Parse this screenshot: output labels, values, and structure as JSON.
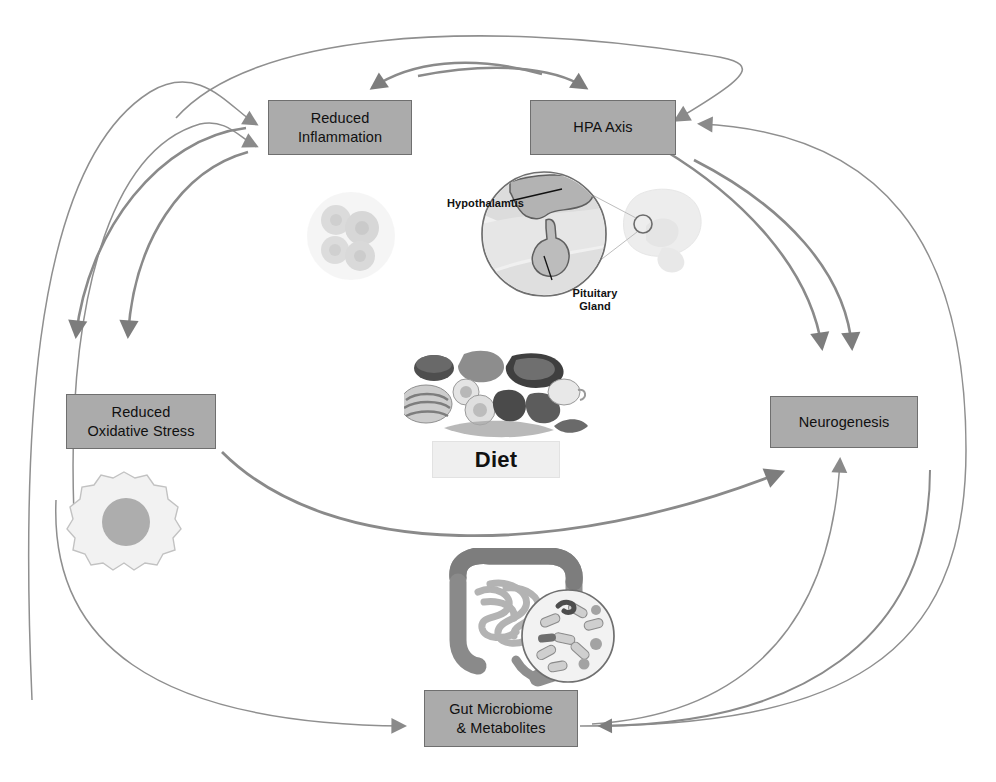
{
  "figure": {
    "type": "cyclical pathway diagram",
    "background_color": "#ffffff",
    "node_fill": "#ababab",
    "node_border": "#6f6f6f",
    "arrow_color_thick": "#808080",
    "arrow_color_thin": "#8f8f8f"
  },
  "nodes": [
    {
      "id": "reduced-inflammation",
      "line1": "Reduced",
      "line2": "Inflammation"
    },
    {
      "id": "hpa-axis",
      "line1": "HPA Axis",
      "line2": ""
    },
    {
      "id": "reduced-oxidative",
      "line1": "Reduced",
      "line2": "Oxidative Stress"
    },
    {
      "id": "neurogenesis",
      "line1": "Neurogenesis",
      "line2": ""
    },
    {
      "id": "gut-microbiome",
      "line1": "Gut Microbiome",
      "line2": "& Metabolites"
    }
  ],
  "center": {
    "diet_label": "Diet"
  },
  "illustration_labels": {
    "hypothalamus": "Hypothalamus",
    "pituitary_line1": "Pituitary",
    "pituitary_line2": "Gland"
  },
  "illustrations": [
    {
      "id": "immune-cells",
      "name": "immune-cell-cluster-illustration"
    },
    {
      "id": "hpa",
      "name": "brain-hypothalamus-pituitary-magnifier-illustration"
    },
    {
      "id": "food",
      "name": "assorted-foods-illustration"
    },
    {
      "id": "cell",
      "name": "single-cell-with-nucleus-illustration"
    },
    {
      "id": "gut",
      "name": "intestines-with-bacteria-magnifier-illustration"
    }
  ],
  "edges": [
    {
      "from": "gut-microbiome",
      "to": "reduced-inflammation",
      "style": "thin-arc-left"
    },
    {
      "from": "gut-microbiome",
      "to": "hpa-axis",
      "style": "thin-arc-top"
    },
    {
      "from": "reduced-inflammation",
      "to": "reduced-oxidative",
      "style": "thick-arc-down"
    },
    {
      "from": "hpa-axis",
      "to": "reduced-inflammation",
      "style": "thick-arc-top"
    },
    {
      "from": "reduced-oxidative",
      "to": "neurogenesis",
      "style": "thick-arc-across"
    },
    {
      "from": "reduced-inflammation",
      "to": "neurogenesis",
      "style": "thick-arc-right"
    },
    {
      "from": "hpa-axis",
      "to": "neurogenesis",
      "style": "thick-arc-right-2"
    },
    {
      "from": "neurogenesis",
      "to": "hpa-axis",
      "style": "thin-arc-right-up"
    },
    {
      "from": "gut-microbiome",
      "to": "neurogenesis",
      "style": "thin-arc-up"
    },
    {
      "from": "neurogenesis",
      "to": "gut-microbiome",
      "style": "thick-arc-down-left"
    },
    {
      "from": "reduced-oxidative",
      "to": "gut-microbiome",
      "style": "thin-arc-bottom-left"
    }
  ]
}
